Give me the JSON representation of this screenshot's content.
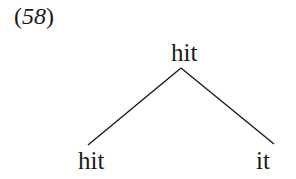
{
  "example": {
    "number_open": "(",
    "number_digits": "58",
    "number_close": ")"
  },
  "tree": {
    "root": {
      "label": "hit"
    },
    "children": [
      {
        "label": "hit"
      },
      {
        "label": "it"
      }
    ],
    "edge_color": "#1a1a1a"
  }
}
